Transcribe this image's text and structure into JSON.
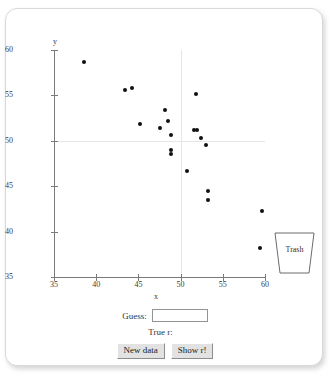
{
  "app": {
    "title": "Guess the Correlation"
  },
  "chart_data": {
    "type": "scatter",
    "title": "",
    "xlabel": "x",
    "ylabel": "y",
    "xlim": [
      35,
      60
    ],
    "ylim": [
      35,
      60
    ],
    "xticks": [
      35,
      40,
      45,
      50,
      55,
      60
    ],
    "yticks": [
      35,
      40,
      45,
      50,
      55,
      60
    ],
    "grid": true,
    "gridlines": {
      "horizontal": [
        50
      ],
      "vertical": [
        50
      ]
    },
    "legend": null,
    "points": [
      {
        "x": 38.5,
        "y": 58.7
      },
      {
        "x": 43.4,
        "y": 55.6
      },
      {
        "x": 44.3,
        "y": 55.8
      },
      {
        "x": 45.2,
        "y": 51.9
      },
      {
        "x": 47.6,
        "y": 51.4
      },
      {
        "x": 48.1,
        "y": 53.4
      },
      {
        "x": 48.5,
        "y": 52.2
      },
      {
        "x": 48.9,
        "y": 50.6
      },
      {
        "x": 48.9,
        "y": 49.0
      },
      {
        "x": 48.9,
        "y": 48.6
      },
      {
        "x": 50.7,
        "y": 46.7
      },
      {
        "x": 51.6,
        "y": 51.2
      },
      {
        "x": 51.9,
        "y": 51.2
      },
      {
        "x": 51.8,
        "y": 55.1
      },
      {
        "x": 52.4,
        "y": 50.3
      },
      {
        "x": 53.0,
        "y": 49.5
      },
      {
        "x": 53.3,
        "y": 44.5
      },
      {
        "x": 53.2,
        "y": 43.5
      },
      {
        "x": 59.4,
        "y": 38.2
      },
      {
        "x": 59.7,
        "y": 42.3
      }
    ]
  },
  "trash": {
    "label": "Trash"
  },
  "controls": {
    "guess_label": "Guess:",
    "guess_value": "",
    "guess_placeholder": "",
    "true_r_label": "True r:",
    "true_r_value": "",
    "new_data_label": "New data",
    "show_r_label": "Show r!"
  },
  "colors": {
    "point": "#111111",
    "axis": "#7a7a7a",
    "grid": "#e6e6e6",
    "panel_border": "#d9d9d9",
    "button_face": "#e2e2e2"
  }
}
